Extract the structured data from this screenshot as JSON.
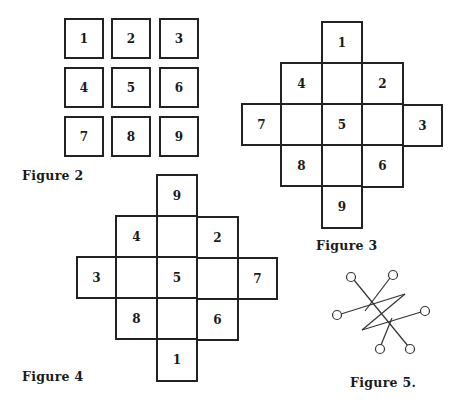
{
  "figure2": {
    "caption": "Figure 2",
    "cells": [
      "1",
      "2",
      "3",
      "4",
      "5",
      "6",
      "7",
      "8",
      "9"
    ]
  },
  "figure3": {
    "caption": "Figure 3",
    "cells": {
      "top": "1",
      "upper_left": "4",
      "upper_center": "",
      "upper_right": "2",
      "far_left": "7",
      "mid_left": "",
      "center": "5",
      "mid_right": "",
      "far_right": "3",
      "lower_left": "8",
      "lower_center": "",
      "lower_right": "6",
      "bottom": "9"
    }
  },
  "figure4": {
    "caption": "Figure 4",
    "cells": {
      "top": "9",
      "upper_left": "4",
      "upper_center": "",
      "upper_right": "2",
      "far_left": "3",
      "mid_left": "",
      "center": "5",
      "mid_right": "",
      "far_right": "7",
      "lower_left": "8",
      "lower_center": "",
      "lower_right": "6",
      "bottom": "1"
    }
  },
  "figure5": {
    "caption": "Figure 5.",
    "node_count": 6
  }
}
